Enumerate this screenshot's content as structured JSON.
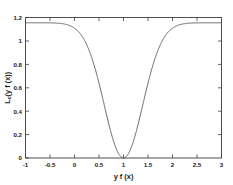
{
  "chart_data": {
    "type": "line",
    "title": "",
    "xlabel": "y f (x)",
    "ylabel": "L_c(y f (x))",
    "ylabel_main": "L",
    "ylabel_sub": "c",
    "ylabel_rest": "(y f (x))",
    "xlim": [
      -1,
      3
    ],
    "ylim": [
      0,
      1.2
    ],
    "grid": false,
    "legend": null,
    "xticks": [
      -1,
      -0.5,
      0,
      0.5,
      1,
      1.5,
      2,
      2.5,
      3
    ],
    "xtick_labels": [
      "-1",
      "-0.5",
      "0",
      "0.5",
      "1",
      "1.5",
      "2",
      "2.5",
      "3"
    ],
    "yticks": [
      0,
      0.2,
      0.4,
      0.6,
      0.8,
      1,
      1.2
    ],
    "ytick_labels": [
      "0",
      "0.2",
      "0.4",
      "0.6",
      "0.8",
      "1",
      "1.2"
    ],
    "curve_color": "#4a4a4a",
    "series": [
      {
        "name": "C-loss",
        "x": [
          -1,
          -0.9,
          -0.8,
          -0.7,
          -0.6,
          -0.5,
          -0.4,
          -0.3,
          -0.2,
          -0.1,
          0,
          0.1,
          0.2,
          0.3,
          0.4,
          0.5,
          0.6,
          0.7,
          0.8,
          0.9,
          1,
          1.1,
          1.2,
          1.3,
          1.4,
          1.5,
          1.6,
          1.7,
          1.8,
          1.9,
          2,
          2.1,
          2.2,
          2.3,
          2.4,
          2.5,
          2.6,
          2.7,
          2.8,
          2.9,
          3
        ],
        "values": [
          1.155,
          1.155,
          1.154,
          1.154,
          1.152,
          1.15,
          1.146,
          1.139,
          1.127,
          1.107,
          1.076,
          1.03,
          0.965,
          0.878,
          0.769,
          0.639,
          0.496,
          0.35,
          0.213,
          0.1,
          0.0,
          0.1,
          0.213,
          0.35,
          0.496,
          0.639,
          0.769,
          0.878,
          0.965,
          1.03,
          1.076,
          1.107,
          1.127,
          1.139,
          1.146,
          1.15,
          1.152,
          1.154,
          1.154,
          1.155,
          1.155
        ]
      }
    ],
    "minimum": {
      "x": 1,
      "y": 0
    },
    "plateau_value": 1.155
  },
  "axes": {
    "x_title": "y f (x)",
    "y_title_main": "L",
    "y_title_sub": "c",
    "y_title_rest": "(y f (x))"
  }
}
